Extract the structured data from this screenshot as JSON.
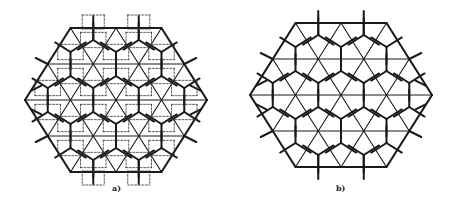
{
  "figure": {
    "panels": [
      {
        "id": "a",
        "label": "a)",
        "description": "Hexagonal patch of triangular lattice with overlaid pentagonal (Cairo-type) tiling and dashed square/cross sub-tiling",
        "center": [
          116,
          100
        ],
        "radius_x": 91,
        "radius_y": 72,
        "stroke_color": "#1a1a1a",
        "dashed_overlay": true
      },
      {
        "id": "b",
        "label": "b)",
        "description": "Hexagonal patch of triangular lattice with overlaid pentagonal (Cairo-type) tiling",
        "center": [
          341,
          95
        ],
        "radius_x": 91,
        "radius_y": 72,
        "stroke_color": "#1a1a1a",
        "dashed_overlay": false
      }
    ]
  }
}
